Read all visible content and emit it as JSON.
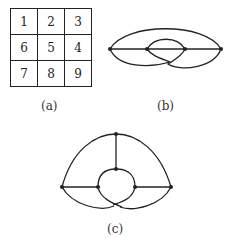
{
  "figure_a": {
    "grid": [
      [
        "1",
        "2",
        "3"
      ],
      [
        "6",
        "5",
        "4"
      ],
      [
        "7",
        "8",
        "9"
      ]
    ],
    "caption": "(a)"
  },
  "figure_b": {
    "caption": "(b)",
    "nodes": 4
  },
  "figure_c": {
    "caption": "(c)",
    "nodes": 6
  },
  "colors": {
    "stroke": "#222222",
    "background": "#ffffff"
  }
}
